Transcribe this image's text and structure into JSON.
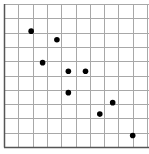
{
  "chart_data": {
    "type": "scatter",
    "title": "",
    "xlabel": "",
    "ylabel": "",
    "xlim": [
      0,
      10
    ],
    "ylim": [
      0,
      10
    ],
    "grid": true,
    "legend": null,
    "series": [
      {
        "name": "points",
        "color": "#000000",
        "points": [
          {
            "x": 1.9,
            "y": 8.1
          },
          {
            "x": 3.7,
            "y": 7.5
          },
          {
            "x": 2.7,
            "y": 5.9
          },
          {
            "x": 4.5,
            "y": 5.3
          },
          {
            "x": 5.7,
            "y": 5.3
          },
          {
            "x": 4.5,
            "y": 3.8
          },
          {
            "x": 7.6,
            "y": 3.1
          },
          {
            "x": 6.7,
            "y": 2.3
          },
          {
            "x": 9.0,
            "y": 0.8
          }
        ]
      }
    ]
  },
  "style": {
    "grid_color": "#a8a8a8",
    "axis_color": "#555555",
    "point_color": "#000000"
  }
}
